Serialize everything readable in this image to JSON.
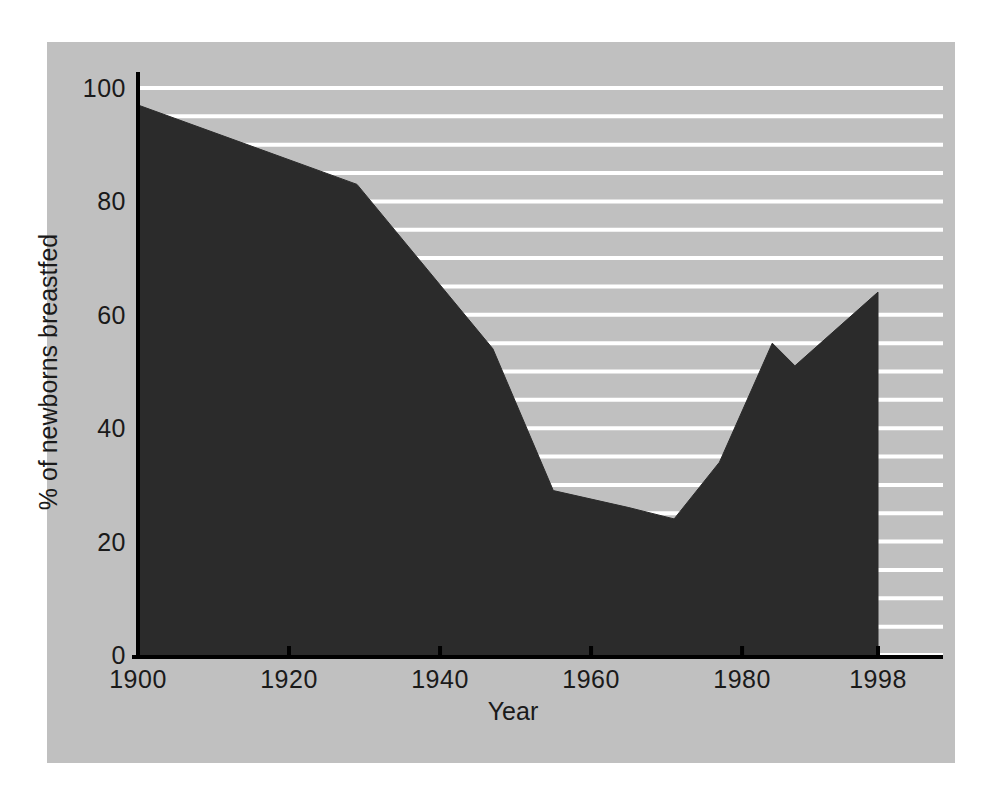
{
  "chart_data": {
    "type": "area",
    "title": "",
    "xlabel": "Year",
    "ylabel": "% of newborns breastfed",
    "xlim": [
      1900,
      2000
    ],
    "ylim": [
      0,
      100
    ],
    "xticks": [
      1900,
      1920,
      1940,
      1960,
      1980,
      1998
    ],
    "xtick_labels": [
      "1900",
      "1920",
      "1940",
      "1960",
      "1980",
      "1998"
    ],
    "yticks": [
      0,
      20,
      40,
      60,
      80,
      100
    ],
    "ytick_labels": [
      "0",
      "20",
      "40",
      "60",
      "80",
      "100"
    ],
    "grid": true,
    "grid_orientation": "horizontal",
    "grid_step": 5,
    "grid_color": "#ffffff",
    "legend": "none",
    "series": [
      {
        "name": "% of newborns breastfed",
        "fill_color": "#2b2b2b",
        "x": [
          1900,
          1929,
          1947,
          1955,
          1965,
          1971,
          1977,
          1984,
          1987,
          1998
        ],
        "values": [
          97,
          83,
          54,
          29,
          26,
          24,
          34,
          55,
          51,
          64
        ]
      }
    ]
  },
  "figure": {
    "background_color": "#ffffff",
    "panel_color": "#c0c0c0",
    "axis_color": "#000000",
    "text_color": "#1a1a1a"
  }
}
